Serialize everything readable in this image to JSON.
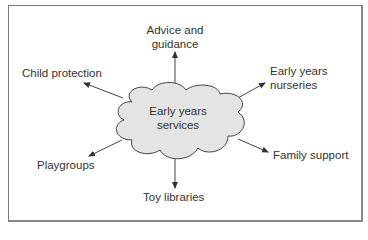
{
  "diagram": {
    "center": {
      "line1": "Early years",
      "line2": "services"
    },
    "nodes": [
      {
        "id": "advice",
        "line1": "Advice and",
        "line2": "guidance"
      },
      {
        "id": "child-protection",
        "line1": "Child protection"
      },
      {
        "id": "nurseries",
        "line1": "Early years",
        "line2": "nurseries"
      },
      {
        "id": "playgroups",
        "line1": "Playgroups"
      },
      {
        "id": "family-support",
        "line1": "Family support"
      },
      {
        "id": "toy-libraries",
        "line1": "Toy libraries"
      }
    ],
    "colors": {
      "cloud_fill": "#e4e4e4",
      "stroke": "#444444",
      "frame": "#777777"
    }
  }
}
